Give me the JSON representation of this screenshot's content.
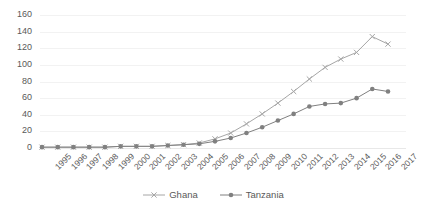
{
  "chart_data": {
    "type": "line",
    "title": "",
    "xlabel": "",
    "ylabel": "",
    "ylim": [
      0,
      160
    ],
    "ytick_step": 20,
    "yticks": [
      0,
      20,
      40,
      60,
      80,
      100,
      120,
      140,
      160
    ],
    "grid": true,
    "legend_position": "bottom",
    "categories": [
      "1995",
      "1996",
      "1997",
      "1998",
      "1999",
      "2000",
      "2001",
      "2002",
      "2003",
      "2004",
      "2005",
      "2006",
      "2007",
      "2008",
      "2009",
      "2010",
      "2011",
      "2012",
      "2013",
      "2014",
      "2015",
      "2016",
      "2017"
    ],
    "series": [
      {
        "name": "Ghana",
        "marker": "x",
        "color": "#A6A6A6",
        "values": [
          1,
          1,
          1,
          1,
          1,
          2,
          2,
          2,
          3,
          4,
          6,
          11,
          18,
          29,
          41,
          54,
          68,
          83,
          97,
          107,
          115,
          134,
          125
        ]
      },
      {
        "name": "Tanzania",
        "marker": "circle",
        "color": "#808080",
        "values": [
          1,
          1,
          1,
          1,
          1,
          2,
          2,
          2,
          3,
          4,
          5,
          8,
          12,
          18,
          25,
          33,
          41,
          50,
          53,
          54,
          60,
          71,
          68
        ]
      }
    ]
  },
  "legend": {
    "entries": [
      {
        "label": "Ghana"
      },
      {
        "label": "Tanzania"
      }
    ]
  }
}
